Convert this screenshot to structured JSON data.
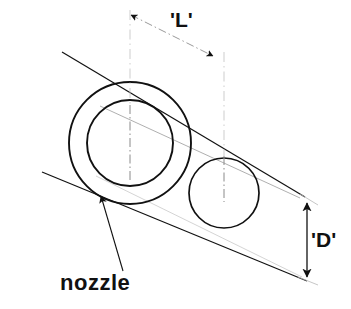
{
  "figure": {
    "background_color": "#ffffff",
    "line_color": "#111111",
    "faint_line_color": "#9a9a9a"
  },
  "labels": {
    "length_dimension": "'L'",
    "diameter_dimension": "'D'",
    "nozzle": "nozzle"
  },
  "geometry": {
    "outer_circle": {
      "cx": 130,
      "cy": 143,
      "r": 61
    },
    "inner_circle": {
      "cx": 130,
      "cy": 143,
      "r": 43
    },
    "small_circle": {
      "cx": 224,
      "cy": 193,
      "r": 35
    },
    "band_upper_line": {
      "x1": 62,
      "y1": 52,
      "x2": 305,
      "y2": 197
    },
    "band_lower_line": {
      "x1": 42,
      "y1": 172,
      "x2": 307,
      "y2": 281
    },
    "length_dimension_line": {
      "x1": 128,
      "y1": 14,
      "x2": 216,
      "y2": 58
    },
    "diameter_dimension_line": {
      "x1": 307,
      "y1": 202,
      "x2": 307,
      "y2": 278
    },
    "nozzle_leader_line": {
      "x1": 123,
      "y1": 272,
      "x2": 100,
      "y2": 192
    }
  }
}
